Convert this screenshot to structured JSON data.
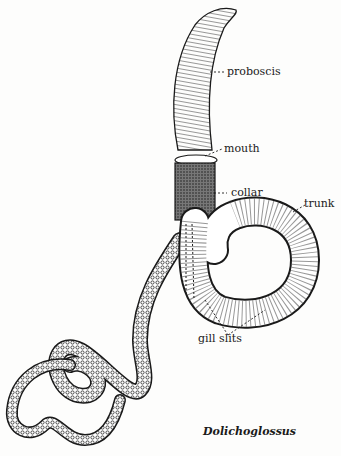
{
  "figure": {
    "caption": "Dolichoglossus",
    "ink_color": "#1a1a1a",
    "background_color": "#fdfdfc"
  },
  "labels": [
    {
      "id": "proboscis",
      "text": "proboscis"
    },
    {
      "id": "mouth",
      "text": "mouth"
    },
    {
      "id": "collar",
      "text": "collar"
    },
    {
      "id": "trunk",
      "text": "trunk"
    },
    {
      "id": "gill-slits",
      "text": "gill slits"
    }
  ]
}
